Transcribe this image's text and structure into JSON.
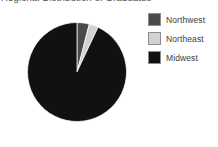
{
  "chart_data": {
    "type": "pie",
    "title": "Regional Distribution of Graduates",
    "xlabel": "",
    "ylabel": "",
    "legend_position": "right",
    "grid": false,
    "categories": [
      "Northwest",
      "Northeast",
      "Midwest"
    ],
    "values": [
      4,
      3,
      93
    ],
    "colors": [
      "#4a4a4a",
      "#d2d2d2",
      "#111111"
    ],
    "series": [
      {
        "name": "Share",
        "values": [
          4,
          3,
          93
        ]
      }
    ],
    "slices": [
      {
        "label": "Northwest",
        "value": 4,
        "color": "#4a4a4a",
        "start_angle": -14.4,
        "end_angle": 0
      },
      {
        "label": "Northeast",
        "value": 3,
        "color": "#d2d2d2",
        "start_angle": -25.2,
        "end_angle": -14.4
      },
      {
        "label": "Midwest",
        "value": 93,
        "color": "#111111",
        "start_angle": 0,
        "end_angle": 334.8
      }
    ]
  },
  "legend": {
    "items": [
      {
        "label": "Northwest",
        "color": "#4a4a4a",
        "border": "#8c8c8c"
      },
      {
        "label": "Northeast",
        "color": "#d2d2d2",
        "border": "#8c8c8c"
      },
      {
        "label": "Midwest",
        "color": "#111111",
        "border": "#8c8c8c"
      }
    ]
  }
}
